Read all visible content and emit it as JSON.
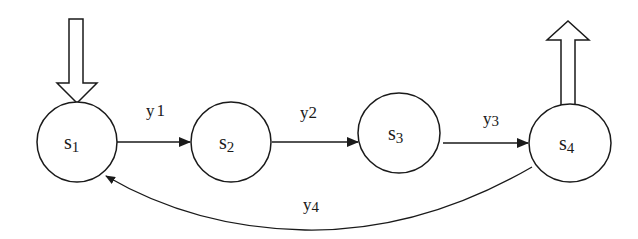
{
  "diagram": {
    "type": "state-machine",
    "colors": {
      "stroke": "#1a1a1a",
      "background": "#ffffff"
    },
    "states": [
      {
        "id": "s1",
        "base": "s",
        "sub": "1",
        "cx": 77,
        "cy": 142,
        "rx": 40,
        "ry": 40
      },
      {
        "id": "s2",
        "base": "s",
        "sub": "2",
        "cx": 231,
        "cy": 142,
        "rx": 40,
        "ry": 40
      },
      {
        "id": "s3",
        "base": "s",
        "sub": "3",
        "cx": 399,
        "cy": 133,
        "rx": 41,
        "ry": 40
      },
      {
        "id": "s4",
        "base": "s",
        "sub": "4",
        "cx": 570,
        "cy": 143,
        "rx": 41,
        "ry": 39
      }
    ],
    "transitions": [
      {
        "id": "t1",
        "from": "s1",
        "to": "s2",
        "label_base": "y",
        "label_sub": "1"
      },
      {
        "id": "t2",
        "from": "s2",
        "to": "s3",
        "label_base": "y",
        "label_sub": "2"
      },
      {
        "id": "t3",
        "from": "s3",
        "to": "s4",
        "label_base": "y",
        "label_sub": "3"
      },
      {
        "id": "t4",
        "from": "s4",
        "to": "s1",
        "label_base": "y",
        "label_sub": "4"
      }
    ],
    "entry_arrow": {
      "target": "s1",
      "direction": "down"
    },
    "exit_arrow": {
      "source": "s4",
      "direction": "up"
    }
  }
}
